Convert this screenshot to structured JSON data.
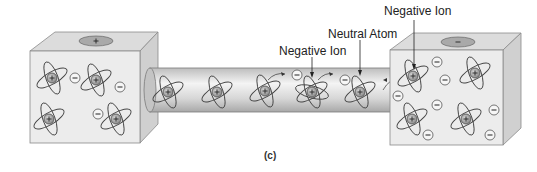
{
  "labels": {
    "negative_ion_top": "Negative Ion",
    "neutral_atom": "Neutral Atom",
    "negative_ion_tube": "Negative Ion",
    "caption": "(c)"
  },
  "terminals": {
    "left": {
      "sign": "+",
      "fill": "#a9a9a9"
    },
    "right": {
      "sign": "−",
      "fill": "#a9a9a9"
    }
  },
  "colors": {
    "box_front": "#ececec",
    "box_top": "#dcdcdc",
    "box_side": "#d2d2d2",
    "tube": "#d8d8d8",
    "outline": "#6e6e6e",
    "nucleus": "#9e9e9e"
  },
  "symbols": {
    "positive": "+",
    "negative": "−"
  }
}
